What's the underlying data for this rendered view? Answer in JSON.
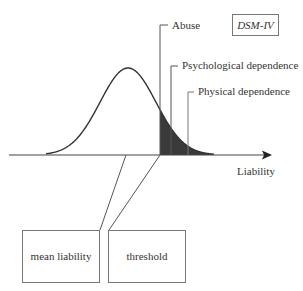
{
  "diagram": {
    "type": "liability-threshold model",
    "axis_label": "Liability",
    "legend_box": "DSM-IV",
    "thresholds": [
      {
        "label": "Abuse",
        "x": 160,
        "label_y": 28
      },
      {
        "label": "Psychological dependence",
        "x": 171,
        "label_y": 68
      },
      {
        "label": "Physical dependence",
        "x": 188,
        "label_y": 94
      }
    ],
    "boxes": [
      {
        "label": "mean liability"
      },
      {
        "label": "threshold"
      }
    ],
    "colors": {
      "line": "#333333",
      "shade": "#3a3a3a",
      "text": "#333333",
      "box_border": "#666666"
    }
  }
}
